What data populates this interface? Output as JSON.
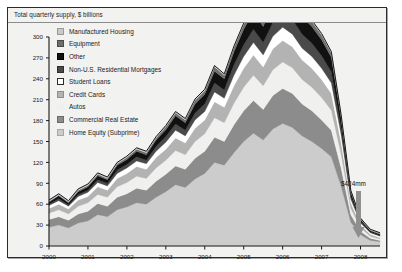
{
  "chart": {
    "title": "Total quarterly supply, $ billions",
    "annotation": "$424mm"
  },
  "legend": {
    "items": [
      {
        "label": "Manufactured Housing",
        "color": "#c9c9c9",
        "border": "#9a9a9a"
      },
      {
        "label": "Equipment",
        "color": "#6e6e6e",
        "border": "#4a4a4a"
      },
      {
        "label": "Other",
        "color": "#111111",
        "border": "#000000"
      },
      {
        "label": "Non-U.S. Residential Mortgages",
        "color": "#4a4a4a",
        "border": "#2e2e2e"
      },
      {
        "label": "Student Loans",
        "color": "#ffffff",
        "border": "#2b2b2b"
      },
      {
        "label": "Credit Cards",
        "color": "#b3b3b3",
        "border": "#8f8f8f"
      },
      {
        "label": "Autos",
        "color": "#f0f0ee",
        "border": "#f0f0ee"
      },
      {
        "label": "Commercial Real Estate",
        "color": "#8c8c8c",
        "border": "#6b6b6b"
      },
      {
        "label": "Home Equity (Subprime)",
        "color": "#cccccc",
        "border": "#a8a8a8"
      }
    ]
  },
  "chart_data": {
    "type": "area",
    "title": "Total quarterly supply, $ billions",
    "xlabel": "",
    "ylabel": "",
    "ylim": [
      0,
      300
    ],
    "yticks": [
      0,
      30,
      60,
      90,
      120,
      150,
      180,
      210,
      240,
      270,
      300
    ],
    "grid": false,
    "legend_position": "top-left inside plot",
    "stacked": true,
    "stack_order_bottom_to_top": [
      "Home Equity (Subprime)",
      "Commercial Real Estate",
      "Autos",
      "Credit Cards",
      "Student Loans",
      "Non-U.S. Residential Mortgages",
      "Other",
      "Equipment",
      "Manufactured Housing"
    ],
    "categories": [
      "2000Q1",
      "2000Q2",
      "2000Q3",
      "2000Q4",
      "2001Q1",
      "2001Q2",
      "2001Q3",
      "2001Q4",
      "2002Q1",
      "2002Q2",
      "2002Q3",
      "2002Q4",
      "2003Q1",
      "2003Q2",
      "2003Q3",
      "2003Q4",
      "2004Q1",
      "2004Q2",
      "2004Q3",
      "2004Q4",
      "2005Q1",
      "2005Q2",
      "2005Q3",
      "2005Q4",
      "2006Q1",
      "2006Q2",
      "2006Q3",
      "2006Q4",
      "2007Q1",
      "2007Q2",
      "2007Q3",
      "2007Q4",
      "2008Q1",
      "2008Q2",
      "2008Q3"
    ],
    "xticks": [
      "2000",
      "2001",
      "2002",
      "2003",
      "2004",
      "2005",
      "2006",
      "2007",
      "2008"
    ],
    "series": [
      {
        "name": "Home Equity (Subprime)",
        "color": "#cccccc",
        "values": [
          27,
          30,
          26,
          33,
          36,
          45,
          42,
          52,
          56,
          62,
          60,
          70,
          78,
          88,
          84,
          96,
          104,
          120,
          116,
          134,
          150,
          162,
          152,
          168,
          176,
          170,
          158,
          150,
          140,
          128,
          86,
          34,
          16,
          8,
          6
        ]
      },
      {
        "name": "Commercial Real Estate",
        "color": "#8c8c8c",
        "values": [
          11,
          12,
          11,
          13,
          14,
          16,
          15,
          18,
          19,
          21,
          20,
          23,
          25,
          27,
          26,
          30,
          32,
          36,
          34,
          40,
          44,
          47,
          44,
          48,
          50,
          49,
          46,
          44,
          41,
          38,
          26,
          11,
          5,
          3,
          2
        ]
      },
      {
        "name": "Autos",
        "color": "#f0f0ee",
        "values": [
          9,
          10,
          9,
          11,
          12,
          13,
          13,
          15,
          16,
          17,
          17,
          19,
          20,
          22,
          21,
          24,
          25,
          28,
          27,
          31,
          34,
          36,
          34,
          37,
          38,
          37,
          35,
          34,
          32,
          29,
          20,
          9,
          5,
          3,
          2
        ]
      },
      {
        "name": "Credit Cards",
        "color": "#b3b3b3",
        "values": [
          7,
          8,
          7,
          9,
          9,
          11,
          10,
          12,
          13,
          14,
          13,
          15,
          16,
          18,
          17,
          19,
          20,
          23,
          22,
          25,
          27,
          29,
          27,
          30,
          31,
          30,
          28,
          27,
          26,
          24,
          17,
          8,
          4,
          3,
          2
        ]
      },
      {
        "name": "Student Loans",
        "color": "#ffffff",
        "values": [
          4,
          5,
          4,
          5,
          6,
          6,
          6,
          7,
          8,
          8,
          8,
          9,
          10,
          11,
          10,
          12,
          12,
          14,
          13,
          15,
          17,
          18,
          17,
          18,
          19,
          18,
          17,
          17,
          16,
          15,
          11,
          5,
          3,
          2,
          2
        ]
      },
      {
        "name": "Non-U.S. Residential Mortgages",
        "color": "#4a4a4a",
        "values": [
          2,
          3,
          2,
          3,
          3,
          4,
          4,
          5,
          5,
          6,
          5,
          7,
          8,
          9,
          8,
          10,
          11,
          13,
          12,
          15,
          17,
          19,
          18,
          20,
          22,
          21,
          20,
          19,
          18,
          16,
          10,
          4,
          2,
          1,
          1
        ]
      },
      {
        "name": "Other",
        "color": "#111111",
        "values": [
          3,
          4,
          3,
          4,
          5,
          6,
          5,
          7,
          7,
          8,
          8,
          9,
          10,
          12,
          11,
          13,
          14,
          17,
          16,
          19,
          22,
          25,
          23,
          26,
          28,
          27,
          25,
          24,
          23,
          21,
          14,
          6,
          3,
          2,
          2
        ]
      },
      {
        "name": "Equipment",
        "color": "#6e6e6e",
        "values": [
          1,
          1,
          1,
          2,
          2,
          2,
          2,
          2,
          3,
          3,
          3,
          3,
          4,
          4,
          4,
          5,
          5,
          6,
          5,
          6,
          7,
          8,
          7,
          8,
          8,
          8,
          7,
          7,
          7,
          6,
          4,
          2,
          1,
          1,
          1
        ]
      },
      {
        "name": "Manufactured Housing",
        "color": "#c9c9c9",
        "values": [
          2,
          2,
          2,
          2,
          2,
          2,
          2,
          2,
          2,
          2,
          2,
          2,
          2,
          2,
          2,
          2,
          2,
          2,
          2,
          2,
          2,
          2,
          2,
          2,
          2,
          2,
          2,
          2,
          2,
          2,
          1,
          1,
          1,
          1,
          1
        ]
      }
    ]
  }
}
